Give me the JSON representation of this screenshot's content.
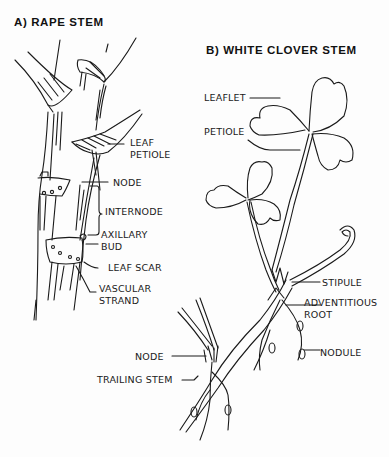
{
  "diagram": {
    "panel_a": {
      "title": "A) RAPE STEM",
      "labels": {
        "leaf": "LEAF",
        "petiole": "PETIOLE",
        "node": "NODE",
        "internode": "INTERNODE",
        "axillary": "AXILLARY",
        "bud": "BUD",
        "leaf_scar": "LEAF SCAR",
        "vascular": "VASCULAR",
        "strand": "STRAND"
      }
    },
    "panel_b": {
      "title": "B) WHITE CLOVER STEM",
      "labels": {
        "leaflet": "LEAFLET",
        "petiole": "PETIOLE",
        "stipule": "STIPULE",
        "adventitious": "ADVENTITIOUS",
        "root": "ROOT",
        "nodule": "NODULE",
        "node": "NODE",
        "trailing_stem": "TRAILING STEM"
      }
    }
  }
}
